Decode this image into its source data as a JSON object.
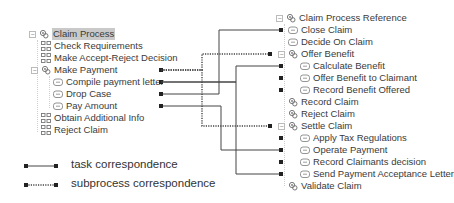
{
  "left_tree": {
    "root": "Claim Process",
    "items": [
      {
        "label": "Check Requirements",
        "icon": "task-group-icon"
      },
      {
        "label": "Make Accept-Reject Decision",
        "icon": "task-group-icon"
      },
      {
        "label": "Make Payment",
        "icon": "subprocess-icon",
        "expandable": true
      },
      {
        "label": "Compile payment letter",
        "icon": "task-icon",
        "child": true
      },
      {
        "label": "Drop Case",
        "icon": "task-icon",
        "child": true
      },
      {
        "label": "Pay Amount",
        "icon": "task-icon",
        "child": true
      },
      {
        "label": "Obtain Additional Info",
        "icon": "task-group-icon"
      },
      {
        "label": "Reject Claim",
        "icon": "task-group-icon"
      }
    ]
  },
  "right_tree": {
    "root": "Claim Process Reference",
    "items": [
      {
        "label": "Close Claim",
        "icon": "task-icon"
      },
      {
        "label": "Decide On Claim",
        "icon": "task-icon"
      },
      {
        "label": "Offer Benefit",
        "icon": "subprocess-icon",
        "expandable": true
      },
      {
        "label": "Calculate Benefit",
        "icon": "task-icon",
        "child": true
      },
      {
        "label": "Offer Benefit to Claimant",
        "icon": "task-icon",
        "child": true
      },
      {
        "label": "Record Benefit Offered",
        "icon": "task-icon",
        "child": true
      },
      {
        "label": "Record Claim",
        "icon": "subprocess-icon"
      },
      {
        "label": "Reject Claim",
        "icon": "subprocess-icon"
      },
      {
        "label": "Settle Claim",
        "icon": "subprocess-icon",
        "expandable": true
      },
      {
        "label": "Apply Tax Regulations",
        "icon": "task-icon",
        "child": true
      },
      {
        "label": "Operate Payment",
        "icon": "task-icon",
        "child": true
      },
      {
        "label": "Record Claimants decision",
        "icon": "task-icon",
        "child": true
      },
      {
        "label": "Send Payment Acceptance Letter",
        "icon": "task-icon",
        "child": true
      },
      {
        "label": "Validate Claim",
        "icon": "subprocess-icon"
      }
    ]
  },
  "correspondences": [
    {
      "type": "subprocess",
      "from": "Make Payment",
      "to": "Offer Benefit"
    },
    {
      "type": "subprocess",
      "from": "Make Payment",
      "to": "Settle Claim"
    },
    {
      "type": "task",
      "from": "Compile payment letter",
      "to": "Calculate Benefit"
    },
    {
      "type": "task",
      "from": "Compile payment letter",
      "to": "Send Payment Acceptance Letter"
    },
    {
      "type": "task",
      "from": "Drop Case",
      "to": "Close Claim"
    },
    {
      "type": "task",
      "from": "Pay Amount",
      "to": "Operate Payment"
    }
  ],
  "legend": {
    "task": "task correspondence",
    "subprocess": "subprocess correspondence"
  },
  "colors": {
    "line": "#444444",
    "marker": "#222222",
    "selected_bg": "#c9c9c9"
  }
}
